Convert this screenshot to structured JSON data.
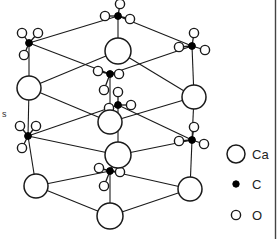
{
  "figure": {
    "edge_label_partial": "s",
    "border_color": "#444444",
    "line_color": "#1a1a1a",
    "atom_outline_color": "#1a1a1a",
    "carbon_fill": "#000000",
    "atom_fill": "#ffffff"
  },
  "legend": {
    "items": [
      {
        "symbol": "Ca",
        "label": "Ca",
        "marker": "large-open-circle",
        "radius": 9
      },
      {
        "symbol": "C",
        "label": "C",
        "marker": "small-filled-dot",
        "radius": 3
      },
      {
        "symbol": "O",
        "label": "O",
        "marker": "small-open-circle",
        "radius": 5
      }
    ]
  },
  "structure": {
    "calcium_atoms": [
      {
        "id": "ca-top-center",
        "x": 118,
        "y": 51,
        "r": 13
      },
      {
        "id": "ca-left-upper",
        "x": 29,
        "y": 88,
        "r": 12
      },
      {
        "id": "ca-right-upper",
        "x": 194,
        "y": 97,
        "r": 12
      },
      {
        "id": "ca-mid-center",
        "x": 110,
        "y": 122,
        "r": 12
      },
      {
        "id": "ca-inner-center",
        "x": 118,
        "y": 155,
        "r": 13
      },
      {
        "id": "ca-left-lower",
        "x": 36,
        "y": 186,
        "r": 12
      },
      {
        "id": "ca-right-lower",
        "x": 190,
        "y": 189,
        "r": 12
      },
      {
        "id": "ca-bottom-center",
        "x": 110,
        "y": 216,
        "r": 13
      }
    ],
    "carbonate_groups": [
      {
        "id": "co3-top-center",
        "cx": 118,
        "cy": 16,
        "oxygens": [
          [
            120,
            4
          ],
          [
            105,
            16
          ],
          [
            130,
            19
          ]
        ]
      },
      {
        "id": "co3-top-left",
        "cx": 29,
        "cy": 43,
        "oxygens": [
          [
            22,
            33
          ],
          [
            38,
            33
          ],
          [
            24,
            55
          ]
        ]
      },
      {
        "id": "co3-top-right",
        "cx": 192,
        "cy": 46,
        "oxygens": [
          [
            194,
            33
          ],
          [
            179,
            47
          ],
          [
            205,
            50
          ]
        ]
      },
      {
        "id": "co3-center-upper",
        "cx": 110,
        "cy": 74,
        "oxygens": [
          [
            98,
            71
          ],
          [
            104,
            90
          ],
          [
            119,
            74
          ]
        ]
      },
      {
        "id": "co3-center-mid",
        "cx": 118,
        "cy": 105,
        "oxygens": [
          [
            109,
            108
          ],
          [
            131,
            105
          ],
          [
            118,
            92
          ]
        ]
      },
      {
        "id": "co3-left-lower",
        "cx": 28,
        "cy": 136,
        "oxygens": [
          [
            20,
            126
          ],
          [
            36,
            126
          ],
          [
            22,
            148
          ]
        ]
      },
      {
        "id": "co3-right-lower",
        "cx": 192,
        "cy": 140,
        "oxygens": [
          [
            194,
            127
          ],
          [
            179,
            141
          ],
          [
            204,
            144
          ]
        ]
      },
      {
        "id": "co3-center-lower",
        "cx": 110,
        "cy": 171,
        "oxygens": [
          [
            99,
            168
          ],
          [
            104,
            186
          ],
          [
            120,
            172
          ]
        ]
      }
    ],
    "bonds": [
      [
        118,
        16,
        29,
        43
      ],
      [
        118,
        16,
        192,
        46
      ],
      [
        29,
        43,
        110,
        74
      ],
      [
        192,
        46,
        110,
        74
      ],
      [
        29,
        43,
        29,
        88
      ],
      [
        192,
        46,
        194,
        97
      ],
      [
        118,
        16,
        118,
        51
      ],
      [
        118,
        51,
        29,
        88
      ],
      [
        118,
        51,
        194,
        97
      ],
      [
        29,
        88,
        110,
        122
      ],
      [
        194,
        97,
        110,
        122
      ],
      [
        110,
        74,
        110,
        122
      ],
      [
        118,
        105,
        118,
        155
      ],
      [
        29,
        88,
        28,
        136
      ],
      [
        194,
        97,
        192,
        140
      ],
      [
        28,
        136,
        118,
        105
      ],
      [
        192,
        140,
        118,
        105
      ],
      [
        28,
        136,
        36,
        186
      ],
      [
        192,
        140,
        190,
        189
      ],
      [
        118,
        155,
        28,
        136
      ],
      [
        118,
        155,
        192,
        140
      ],
      [
        36,
        186,
        110,
        216
      ],
      [
        190,
        189,
        110,
        216
      ],
      [
        110,
        171,
        110,
        216
      ],
      [
        36,
        186,
        110,
        171
      ],
      [
        190,
        189,
        110,
        171
      ],
      [
        118,
        155,
        110,
        171
      ]
    ]
  }
}
